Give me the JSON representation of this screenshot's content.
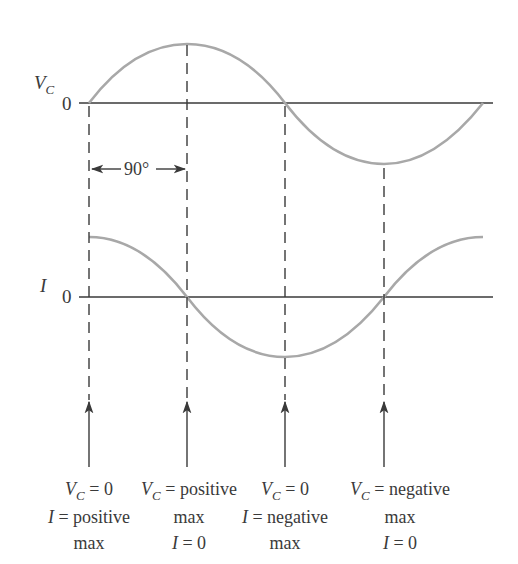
{
  "figure": {
    "top_plot": {
      "label_main": "V",
      "label_sub": "C",
      "zero_label": "0"
    },
    "bottom_plot": {
      "label_main": "I",
      "zero_label": "0"
    },
    "phase_annotation": "90°",
    "captions": [
      {
        "line1_prefix": "V",
        "line1_sub": "C",
        "line1_suffix": " = 0",
        "line2_prefix": "I",
        "line2_suffix": " = positive",
        "line3": "max"
      },
      {
        "line1_prefix": "V",
        "line1_sub": "C",
        "line1_suffix": " = positive",
        "line2": "max",
        "line3_prefix": "I",
        "line3_suffix": " = 0"
      },
      {
        "line1_prefix": "V",
        "line1_sub": "C",
        "line1_suffix": " = 0",
        "line2_prefix": "I",
        "line2_suffix": " = negative",
        "line3": "max"
      },
      {
        "line1_prefix": "V",
        "line1_sub": "C",
        "line1_suffix": " = negative",
        "line2": "max",
        "line3_prefix": "I",
        "line3_suffix": " = 0"
      }
    ],
    "colors": {
      "curve": "#a8a8a8",
      "axis": "#3a3a3a",
      "text": "#3a3a3a"
    },
    "waveforms": [
      {
        "name": "V_C",
        "shape": "sine",
        "phase_deg": 0,
        "period_deg": 360
      },
      {
        "name": "I",
        "shape": "cosine",
        "phase_deg": 90,
        "period_deg": 360
      }
    ],
    "markers_deg": [
      0,
      90,
      180,
      270
    ]
  }
}
